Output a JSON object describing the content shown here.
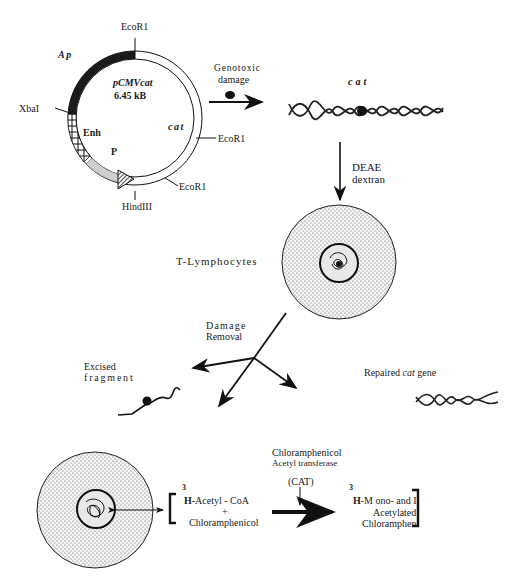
{
  "plasmid": {
    "name": "pCMVcat",
    "size": "6.45 kB",
    "segments": {
      "ap": "Ap",
      "enh": "Enh",
      "promoter": "P",
      "cat": "cat"
    },
    "sites": {
      "ecor1_top": "EcoR1",
      "ecor1_right": "EcoR1",
      "ecor1_bottom": "EcoR1",
      "xbai": "XbaI",
      "hindiii": "HindIII"
    }
  },
  "step1": {
    "label_line1": "Genotoxic",
    "label_line2": "damage"
  },
  "damaged_gene": {
    "label": "cat"
  },
  "step2": {
    "label_line1": "DEAE",
    "label_line2": "dextran"
  },
  "cell": {
    "label": "T-Lymphocytes"
  },
  "step3": {
    "label_line1": "Damage",
    "label_line2": "Removal"
  },
  "excised": {
    "label_line1": "Excised",
    "label_line2": "fragment"
  },
  "repaired": {
    "label_prefix": "Repaired ",
    "label_gene": "cat",
    "label_suffix": " gene"
  },
  "reaction": {
    "enzyme_line1": "Chloramphenicol",
    "enzyme_line2": "Acetyl transferase",
    "enzyme_abbr": "(CAT)",
    "substrate_superscript": "3",
    "substrate_H": "H",
    "substrate_line1": "-Acetyl  -  CoA",
    "substrate_plus": "+",
    "substrate_line2": "Chloramphenicol",
    "product_superscript": "3",
    "product_H": "H",
    "product_line1": "-M  ono-  and  I",
    "product_line2": "Acetylated",
    "product_line3": "Chlorampheni"
  }
}
